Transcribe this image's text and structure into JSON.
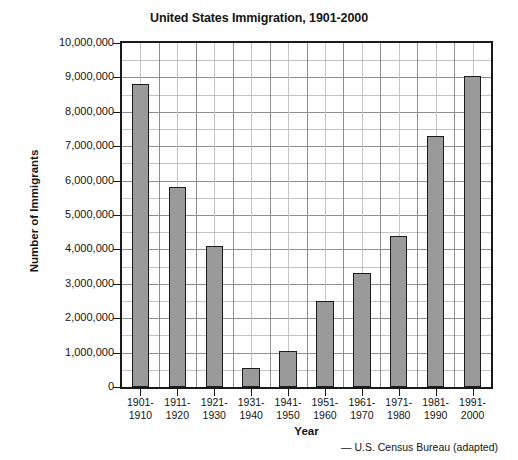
{
  "chart_data": {
    "type": "bar",
    "title": "United States Immigration, 1901-2000",
    "xlabel": "Year",
    "ylabel": "Number of Immigrants",
    "categories": [
      "1901-\n1910",
      "1911-\n1920",
      "1921-\n1930",
      "1931-\n1940",
      "1941-\n1950",
      "1951-\n1960",
      "1961-\n1970",
      "1971-\n1980",
      "1981-\n1990",
      "1991-\n2000"
    ],
    "category_lines": [
      [
        "1901-",
        "1910"
      ],
      [
        "1911-",
        "1920"
      ],
      [
        "1921-",
        "1930"
      ],
      [
        "1931-",
        "1940"
      ],
      [
        "1941-",
        "1950"
      ],
      [
        "1951-",
        "1960"
      ],
      [
        "1961-",
        "1970"
      ],
      [
        "1971-",
        "1980"
      ],
      [
        "1981-",
        "1990"
      ],
      [
        "1991-",
        "2000"
      ]
    ],
    "values": [
      8800000,
      5800000,
      4100000,
      550000,
      1040000,
      2500000,
      3300000,
      4400000,
      7300000,
      9050000
    ],
    "ylim": [
      0,
      10000000
    ],
    "ytick_values": [
      0,
      1000000,
      2000000,
      3000000,
      4000000,
      5000000,
      6000000,
      7000000,
      8000000,
      9000000,
      10000000
    ],
    "ytick_labels": [
      "0",
      "1,000,000",
      "2,000,000",
      "3,000,000",
      "4,000,000",
      "5,000,000",
      "6,000,000",
      "7,000,000",
      "8,000,000",
      "9,000,000",
      "10,000,000"
    ],
    "minor_y_step": 500000,
    "grid": true,
    "legend": null,
    "bar_color": "#9a9a9a",
    "bar_edge_color": "#1c1c1c",
    "grid_color_major": "#8e8e8e",
    "grid_color_minor": "#c4c4c4",
    "axis_color": "#1a1a1a",
    "source": "— U.S. Census Bureau (adapted)"
  }
}
